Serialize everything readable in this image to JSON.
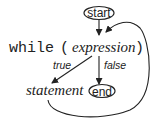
{
  "diagram": {
    "nodes": {
      "start": "start",
      "end": "end",
      "keyword": "while",
      "open_paren": "(",
      "expression": "expression",
      "close_paren": ")",
      "statement": "statement"
    },
    "edges": [
      {
        "from": "start",
        "to": "expression",
        "label": ""
      },
      {
        "from": "expression",
        "to": "statement",
        "label": "true"
      },
      {
        "from": "expression",
        "to": "end",
        "label": "false"
      },
      {
        "from": "statement",
        "to": "expression",
        "label": ""
      }
    ],
    "labels": {
      "true": "true",
      "false": "false"
    }
  }
}
